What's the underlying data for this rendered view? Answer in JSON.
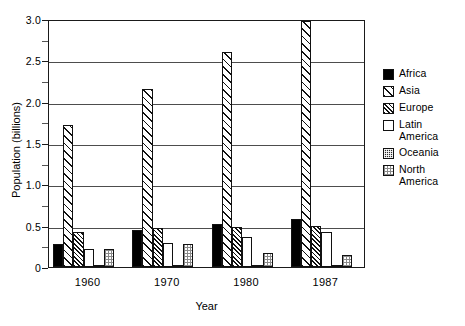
{
  "chart_data": {
    "type": "bar",
    "title": "",
    "xlabel": "Year",
    "ylabel": "Population (billions)",
    "categories": [
      "1960",
      "1970",
      "1980",
      "1987"
    ],
    "ylim": [
      0,
      3.0
    ],
    "ytick_labels": [
      "0",
      "0.5",
      "1.0",
      "1.5",
      "2.0",
      "2.5",
      "3.0"
    ],
    "ytick_values": [
      0,
      0.5,
      1.0,
      1.5,
      2.0,
      2.5,
      3.0
    ],
    "yminor_values": [
      0.25,
      0.75,
      1.25,
      1.75,
      2.25,
      2.75
    ],
    "grid": "horizontal",
    "legend_position": "right",
    "series": [
      {
        "name": "Africa",
        "pattern": "solid-black",
        "values": [
          0.28,
          0.45,
          0.52,
          0.58
        ]
      },
      {
        "name": "Asia",
        "pattern": "sparse-diagonal",
        "values": [
          1.72,
          2.15,
          2.6,
          2.97
        ]
      },
      {
        "name": "Europe",
        "pattern": "dense-diagonal",
        "values": [
          0.42,
          0.47,
          0.49,
          0.5
        ]
      },
      {
        "name": "Latin\nAmerica",
        "pattern": "white",
        "values": [
          0.22,
          0.29,
          0.36,
          0.42
        ]
      },
      {
        "name": "Oceania",
        "pattern": "dark-checker",
        "values": [
          0.02,
          0.02,
          0.02,
          0.03
        ]
      },
      {
        "name": "North\nAmerica",
        "pattern": "light-stipple",
        "values": [
          0.22,
          0.28,
          0.17,
          0.15
        ]
      }
    ]
  },
  "axes": {
    "y_title": "Population (billions)",
    "x_title": "Year"
  },
  "legend": {
    "items": [
      {
        "label": "Africa"
      },
      {
        "label": "Asia"
      },
      {
        "label": "Europe"
      },
      {
        "label": "Latin\nAmerica"
      },
      {
        "label": "Oceania"
      },
      {
        "label": "North\nAmerica"
      }
    ]
  },
  "colors": {
    "axis": "#1a1a1a",
    "grid": "#4d4d4d",
    "background": "#ffffff",
    "ink": "#000000"
  }
}
